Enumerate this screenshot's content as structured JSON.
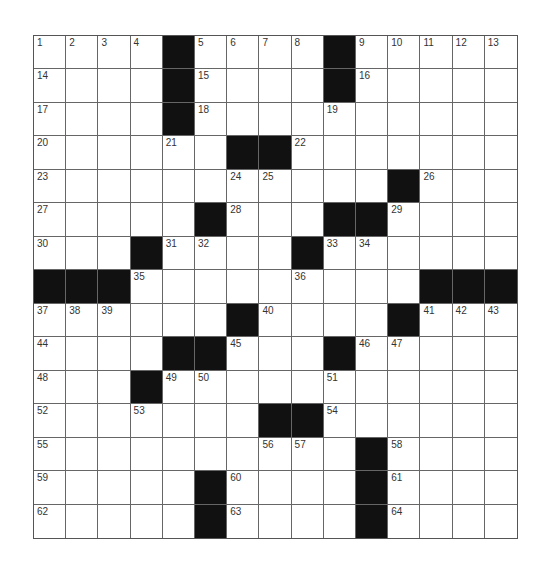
{
  "puzzle": {
    "rows": 15,
    "cols": 15,
    "colors": {
      "black": "#111111",
      "white": "#ffffff",
      "line": "#666666"
    },
    "grid": [
      "....#....#.....",
      "....#....#.....",
      "....#..........",
      "......##.......",
      "...........#...",
      ".....#...##....",
      "...#....#......",
      "###.........###",
      "......#....#...",
      "....##...#.....",
      "...#...........",
      ".......##......",
      "..........#....",
      ".....#....#....",
      ".....#....#...."
    ],
    "numbers": [
      {
        "r": 0,
        "c": 0,
        "n": "1"
      },
      {
        "r": 0,
        "c": 1,
        "n": "2"
      },
      {
        "r": 0,
        "c": 2,
        "n": "3"
      },
      {
        "r": 0,
        "c": 3,
        "n": "4"
      },
      {
        "r": 0,
        "c": 5,
        "n": "5"
      },
      {
        "r": 0,
        "c": 6,
        "n": "6"
      },
      {
        "r": 0,
        "c": 7,
        "n": "7"
      },
      {
        "r": 0,
        "c": 8,
        "n": "8"
      },
      {
        "r": 0,
        "c": 10,
        "n": "9"
      },
      {
        "r": 0,
        "c": 11,
        "n": "10"
      },
      {
        "r": 0,
        "c": 12,
        "n": "11"
      },
      {
        "r": 0,
        "c": 13,
        "n": "12"
      },
      {
        "r": 0,
        "c": 14,
        "n": "13"
      },
      {
        "r": 1,
        "c": 0,
        "n": "14"
      },
      {
        "r": 1,
        "c": 5,
        "n": "15"
      },
      {
        "r": 1,
        "c": 10,
        "n": "16"
      },
      {
        "r": 2,
        "c": 0,
        "n": "17"
      },
      {
        "r": 2,
        "c": 5,
        "n": "18"
      },
      {
        "r": 2,
        "c": 9,
        "n": "19"
      },
      {
        "r": 3,
        "c": 0,
        "n": "20"
      },
      {
        "r": 3,
        "c": 4,
        "n": "21"
      },
      {
        "r": 3,
        "c": 8,
        "n": "22"
      },
      {
        "r": 4,
        "c": 0,
        "n": "23"
      },
      {
        "r": 4,
        "c": 6,
        "n": "24"
      },
      {
        "r": 4,
        "c": 7,
        "n": "25"
      },
      {
        "r": 4,
        "c": 12,
        "n": "26"
      },
      {
        "r": 5,
        "c": 0,
        "n": "27"
      },
      {
        "r": 5,
        "c": 6,
        "n": "28"
      },
      {
        "r": 5,
        "c": 11,
        "n": "29"
      },
      {
        "r": 6,
        "c": 0,
        "n": "30"
      },
      {
        "r": 6,
        "c": 4,
        "n": "31"
      },
      {
        "r": 6,
        "c": 5,
        "n": "32"
      },
      {
        "r": 6,
        "c": 9,
        "n": "33"
      },
      {
        "r": 6,
        "c": 10,
        "n": "34"
      },
      {
        "r": 7,
        "c": 3,
        "n": "35"
      },
      {
        "r": 7,
        "c": 8,
        "n": "36"
      },
      {
        "r": 8,
        "c": 0,
        "n": "37"
      },
      {
        "r": 8,
        "c": 1,
        "n": "38"
      },
      {
        "r": 8,
        "c": 2,
        "n": "39"
      },
      {
        "r": 8,
        "c": 7,
        "n": "40"
      },
      {
        "r": 8,
        "c": 12,
        "n": "41"
      },
      {
        "r": 8,
        "c": 13,
        "n": "42"
      },
      {
        "r": 8,
        "c": 14,
        "n": "43"
      },
      {
        "r": 9,
        "c": 0,
        "n": "44"
      },
      {
        "r": 9,
        "c": 6,
        "n": "45"
      },
      {
        "r": 9,
        "c": 10,
        "n": "46"
      },
      {
        "r": 9,
        "c": 11,
        "n": "47"
      },
      {
        "r": 10,
        "c": 0,
        "n": "48"
      },
      {
        "r": 10,
        "c": 4,
        "n": "49"
      },
      {
        "r": 10,
        "c": 5,
        "n": "50"
      },
      {
        "r": 10,
        "c": 9,
        "n": "51"
      },
      {
        "r": 11,
        "c": 0,
        "n": "52"
      },
      {
        "r": 11,
        "c": 3,
        "n": "53"
      },
      {
        "r": 11,
        "c": 9,
        "n": "54"
      },
      {
        "r": 12,
        "c": 0,
        "n": "55"
      },
      {
        "r": 12,
        "c": 7,
        "n": "56"
      },
      {
        "r": 12,
        "c": 8,
        "n": "57"
      },
      {
        "r": 12,
        "c": 11,
        "n": "58"
      },
      {
        "r": 13,
        "c": 0,
        "n": "59"
      },
      {
        "r": 13,
        "c": 6,
        "n": "60"
      },
      {
        "r": 13,
        "c": 11,
        "n": "61"
      },
      {
        "r": 14,
        "c": 0,
        "n": "62"
      },
      {
        "r": 14,
        "c": 6,
        "n": "63"
      },
      {
        "r": 14,
        "c": 11,
        "n": "64"
      }
    ]
  }
}
